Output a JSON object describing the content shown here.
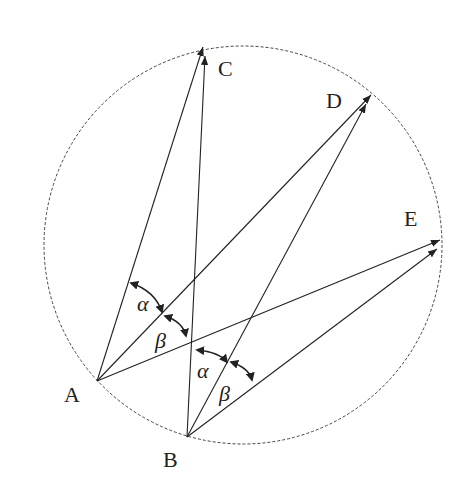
{
  "diagram": {
    "type": "geometry-inscribed-angles",
    "circle": {
      "cx": 243,
      "cy": 245,
      "r": 199,
      "style": "dashed"
    },
    "points": {
      "A": {
        "label": "A",
        "x": 97,
        "y": 381,
        "label_x": 64,
        "label_y": 402
      },
      "B": {
        "label": "B",
        "x": 187,
        "y": 437,
        "label_x": 164,
        "label_y": 467
      },
      "C": {
        "label": "C",
        "x": 204,
        "y": 46,
        "label_x": 218,
        "label_y": 76
      },
      "D": {
        "label": "D",
        "x": 372,
        "y": 94,
        "label_x": 326,
        "label_y": 108
      },
      "E": {
        "label": "E",
        "x": 441,
        "y": 240,
        "label_x": 404,
        "label_y": 226
      }
    },
    "segments": [
      {
        "from": "A",
        "to": "C",
        "arrow": true
      },
      {
        "from": "A",
        "to": "D",
        "arrow": true
      },
      {
        "from": "A",
        "to": "E",
        "arrow": true
      },
      {
        "from": "B",
        "to": "C",
        "arrow": true
      },
      {
        "from": "B",
        "to": "D",
        "arrow": true
      },
      {
        "from": "B",
        "to": "E",
        "arrow": true
      }
    ],
    "angles": [
      {
        "vertex": "A",
        "between": [
          "C",
          "D"
        ],
        "symbol": "α",
        "label_x": 137,
        "label_y": 311
      },
      {
        "vertex": "A",
        "between": [
          "D",
          "E"
        ],
        "symbol": "β",
        "label_x": 155,
        "label_y": 347
      },
      {
        "vertex": "B",
        "between": [
          "C",
          "D"
        ],
        "symbol": "α",
        "label_x": 197,
        "label_y": 378
      },
      {
        "vertex": "B",
        "between": [
          "D",
          "E"
        ],
        "symbol": "β",
        "label_x": 219,
        "label_y": 400
      }
    ],
    "colors": {
      "stroke": "#222222",
      "circle": "#444444",
      "background": "#ffffff"
    }
  }
}
